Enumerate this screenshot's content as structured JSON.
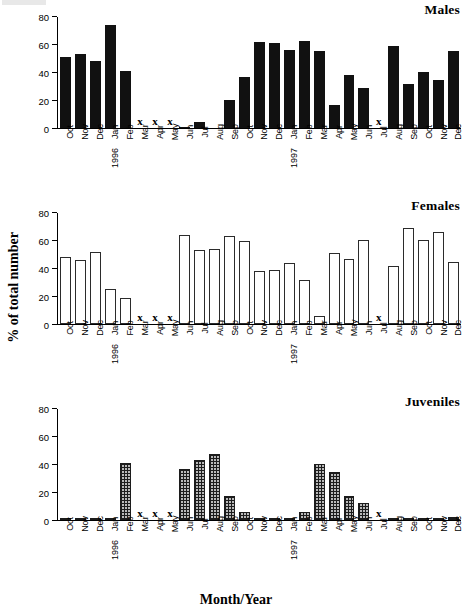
{
  "figure": {
    "xlabel": "Month/Year",
    "ylabel": "% of total number"
  },
  "chart_data": [
    {
      "type": "bar",
      "title": "Males",
      "xlabel": "Month/Year",
      "ylabel": "% of total number",
      "ylim": [
        0,
        80
      ],
      "yticks": [
        0,
        20,
        40,
        60,
        80
      ],
      "grid": false,
      "legend": "none",
      "bar_style": "solid-black",
      "missing_marker": "x",
      "categories": [
        "Oct",
        "Nov",
        "Dec",
        "Jan",
        "Feb",
        "Mar",
        "Apr",
        "May",
        "Jun",
        "Jul",
        "Aug",
        "Sep",
        "Oct",
        "Nov",
        "Dec",
        "Jan",
        "Feb",
        "Mar",
        "Apr",
        "May",
        "Jun",
        "Jul",
        "Aug",
        "Sep",
        "Oct",
        "Nov",
        "Dec"
      ],
      "year_marks": {
        "3": "1996",
        "15": "1997"
      },
      "values": [
        51,
        53.5,
        48,
        74.5,
        41,
        null,
        null,
        null,
        0.6,
        4.5,
        0,
        20.5,
        36.5,
        62,
        61.5,
        56,
        63,
        55.5,
        16.5,
        38.5,
        29,
        null,
        59,
        31.5,
        40.5,
        34.5,
        55.5
      ]
    },
    {
      "type": "bar",
      "title": "Females",
      "xlabel": "Month/Year",
      "ylabel": "% of total number",
      "ylim": [
        0,
        80
      ],
      "yticks": [
        0,
        20,
        40,
        60,
        80
      ],
      "grid": false,
      "legend": "none",
      "bar_style": "open-outline",
      "missing_marker": "x",
      "categories": [
        "Oct",
        "Nov",
        "Dec",
        "Jan",
        "Feb",
        "Mar",
        "Apr",
        "May",
        "Jun",
        "Jul",
        "Aug",
        "Sep",
        "Oct",
        "Nov",
        "Dec",
        "Jan",
        "Feb",
        "Mar",
        "Apr",
        "May",
        "Jun",
        "Jul",
        "Aug",
        "Sep",
        "Oct",
        "Nov",
        "Dec"
      ],
      "year_marks": {
        "3": "1996",
        "15": "1997"
      },
      "values": [
        48.5,
        46,
        52,
        25,
        18.5,
        null,
        null,
        null,
        64,
        53,
        54,
        63.5,
        59.5,
        38.5,
        39,
        44,
        32,
        5.5,
        51.5,
        47,
        60.5,
        null,
        42,
        69,
        60.5,
        66.5,
        45
      ]
    },
    {
      "type": "bar",
      "title": "Juveniles",
      "xlabel": "Month/Year",
      "ylabel": "% of total number",
      "ylim": [
        0,
        80
      ],
      "yticks": [
        0,
        20,
        40,
        60,
        80
      ],
      "grid": false,
      "legend": "none",
      "bar_style": "cross-hatch",
      "missing_marker": "x",
      "categories": [
        "Oct",
        "Nov",
        "Dec",
        "Jan",
        "Feb",
        "Mar",
        "Apr",
        "May",
        "Jun",
        "Jul",
        "Aug",
        "Sep",
        "Oct",
        "Nov",
        "Dec",
        "Jan",
        "Feb",
        "Mar",
        "Apr",
        "May",
        "Jun",
        "Jul",
        "Aug",
        "Sep",
        "Oct",
        "Nov",
        "Dec"
      ],
      "year_marks": {
        "3": "1996",
        "15": "1997"
      },
      "values": [
        0,
        0,
        0,
        0,
        41,
        null,
        null,
        null,
        36.5,
        43,
        47.5,
        17.5,
        5.5,
        0.4,
        0,
        1.8,
        6,
        40.5,
        34.5,
        17,
        12.5,
        null,
        0,
        0.3,
        0,
        0,
        2
      ]
    }
  ]
}
